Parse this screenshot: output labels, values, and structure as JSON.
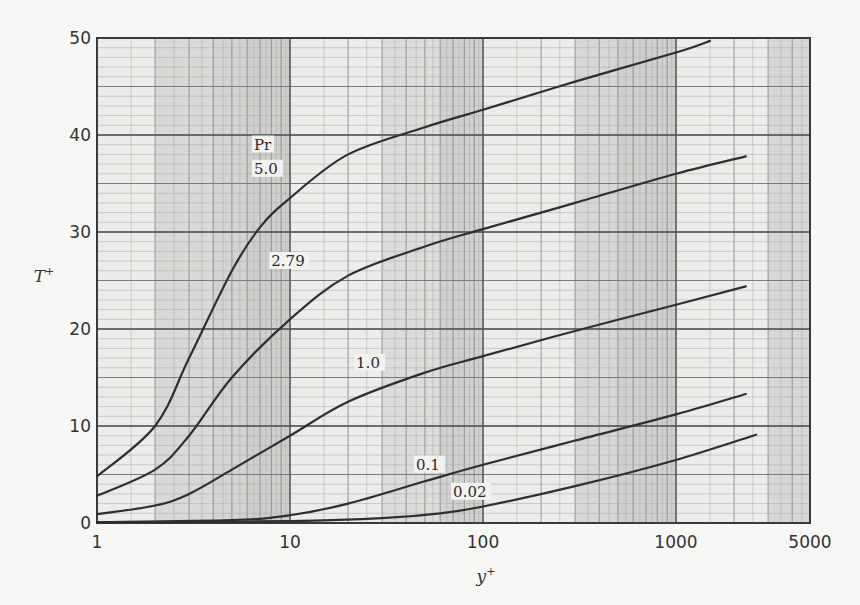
{
  "chart_data": {
    "type": "line",
    "title": "",
    "xlabel": "y+",
    "ylabel": "T+",
    "xscale": "log",
    "xlim": [
      1,
      5000
    ],
    "ylim": [
      0,
      50
    ],
    "grid": true,
    "legend": "inline curve labels",
    "legend_title": "Pr",
    "x_ticks": [
      "1",
      "10",
      "100",
      "1000",
      "5000"
    ],
    "x_tick_values": [
      1,
      10,
      100,
      1000,
      5000
    ],
    "y_ticks": [
      "0",
      "10",
      "20",
      "30",
      "40",
      "50"
    ],
    "y_tick_values": [
      0,
      10,
      20,
      30,
      40,
      50
    ],
    "series": [
      {
        "name": "5.0",
        "x": [
          1,
          2,
          3,
          5,
          7,
          10,
          20,
          50,
          100,
          300,
          1000,
          1500
        ],
        "y": [
          4.8,
          10,
          17,
          26,
          30.5,
          33.5,
          38,
          40.8,
          42.6,
          45.5,
          48.5,
          49.7
        ]
      },
      {
        "name": "2.79",
        "x": [
          1,
          2,
          3,
          5,
          10,
          20,
          50,
          100,
          300,
          1000,
          2300
        ],
        "y": [
          2.8,
          5.5,
          9,
          15,
          21,
          25.5,
          28.5,
          30.3,
          33,
          36,
          37.8
        ]
      },
      {
        "name": "1.0",
        "x": [
          1,
          2,
          3,
          5,
          10,
          20,
          50,
          100,
          300,
          1000,
          2300
        ],
        "y": [
          0.9,
          1.8,
          3,
          5.5,
          9,
          12.5,
          15.5,
          17.2,
          19.8,
          22.5,
          24.4
        ]
      },
      {
        "name": "0.1",
        "x": [
          1,
          5,
          10,
          20,
          50,
          100,
          300,
          1000,
          2300
        ],
        "y": [
          0.1,
          0.3,
          0.8,
          2,
          4.3,
          6,
          8.5,
          11.2,
          13.3
        ]
      },
      {
        "name": "0.02",
        "x": [
          1,
          10,
          30,
          60,
          100,
          300,
          1000,
          2600
        ],
        "y": [
          0.02,
          0.2,
          0.5,
          1,
          1.7,
          3.8,
          6.5,
          9.1
        ]
      }
    ],
    "annotations": [
      {
        "text": "Pr",
        "x": 6.5,
        "y": 38.5
      },
      {
        "text": "5.0",
        "x": 6.5,
        "y": 36
      },
      {
        "text": "2.79",
        "x": 8,
        "y": 26.5
      },
      {
        "text": "1.0",
        "x": 22,
        "y": 16
      },
      {
        "text": "0.1",
        "x": 45,
        "y": 5.5
      },
      {
        "text": "0.02",
        "x": 70,
        "y": 2.7
      }
    ]
  }
}
